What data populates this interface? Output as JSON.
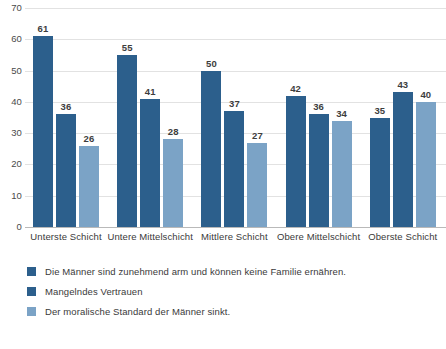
{
  "chart_data": {
    "type": "bar",
    "title": "",
    "subtitle": "",
    "xlabel": "",
    "ylabel": "",
    "ylim": [
      0,
      70
    ],
    "yticks": [
      0,
      10,
      20,
      30,
      40,
      50,
      60,
      70
    ],
    "grid": true,
    "legend_position": "bottom-left",
    "categories": [
      "Unterste Schicht",
      "Untere Mittelschicht",
      "Mittlere Schicht",
      "Obere Mittelschicht",
      "Oberste Schicht"
    ],
    "series": [
      {
        "name": "Die Männer sind zunehmend arm und können keine Familie ernähren.",
        "color": "#2c5f8c",
        "values": [
          61,
          55,
          50,
          42,
          35
        ]
      },
      {
        "name": "Mangelndes Vertrauen",
        "color": "#2c5f8c",
        "values": [
          36,
          41,
          37,
          36,
          43
        ]
      },
      {
        "name": "Der moralische Standard der Männer sinkt.",
        "color": "#7ba3c6",
        "values": [
          26,
          28,
          27,
          34,
          40
        ]
      }
    ]
  },
  "colors": {
    "series_dark": "#2c5f8c",
    "series_light": "#7ba3c6",
    "gridline": "#e2e2e2",
    "axis": "#b9b9b9",
    "text": "#3a3a3a",
    "background": "#ffffff"
  }
}
